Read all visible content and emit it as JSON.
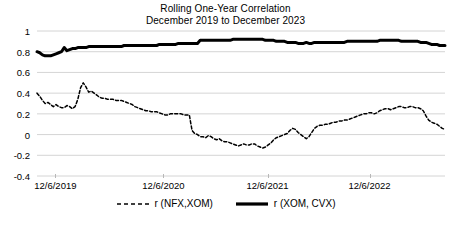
{
  "chart_data": {
    "type": "line",
    "title": "Rolling One-Year Correlation",
    "subtitle": "December 2019 to December 2023",
    "xlabel": "",
    "ylabel": "",
    "ylim": [
      -0.4,
      1
    ],
    "yticks": [
      1,
      0.8,
      0.6,
      0.4,
      0.2,
      0,
      -0.2,
      -0.4
    ],
    "ytick_labels": [
      "1",
      "0.8",
      "0.6",
      "0.4",
      "0.2",
      "0",
      "-0.2",
      "-0.4"
    ],
    "xtick_labels": [
      "12/6/2019",
      "12/6/2020",
      "12/6/2021",
      "12/6/2022"
    ],
    "xtick_positions": [
      0.045,
      0.31,
      0.565,
      0.815
    ],
    "grid": true,
    "legend_position": "bottom",
    "series": [
      {
        "name": "r (NFX,XOM)",
        "style": "dashed",
        "color": "#000000",
        "values": [
          0.4,
          0.37,
          0.33,
          0.3,
          0.31,
          0.29,
          0.27,
          0.29,
          0.27,
          0.26,
          0.26,
          0.28,
          0.27,
          0.25,
          0.27,
          0.34,
          0.45,
          0.5,
          0.46,
          0.41,
          0.42,
          0.4,
          0.38,
          0.36,
          0.35,
          0.35,
          0.34,
          0.34,
          0.34,
          0.33,
          0.33,
          0.33,
          0.32,
          0.31,
          0.3,
          0.29,
          0.27,
          0.26,
          0.25,
          0.24,
          0.23,
          0.23,
          0.22,
          0.22,
          0.22,
          0.21,
          0.2,
          0.19,
          0.19,
          0.2,
          0.2,
          0.2,
          0.2,
          0.2,
          0.19,
          0.19,
          0.19,
          0.04,
          0.01,
          0.0,
          -0.02,
          -0.02,
          -0.03,
          -0.01,
          -0.02,
          -0.04,
          -0.05,
          -0.04,
          -0.06,
          -0.07,
          -0.07,
          -0.08,
          -0.09,
          -0.1,
          -0.11,
          -0.1,
          -0.09,
          -0.1,
          -0.1,
          -0.09,
          -0.09,
          -0.11,
          -0.12,
          -0.13,
          -0.12,
          -0.1,
          -0.08,
          -0.05,
          -0.03,
          -0.02,
          -0.01,
          0.0,
          0.01,
          0.04,
          0.06,
          0.05,
          0.02,
          0.0,
          -0.02,
          -0.04,
          -0.02,
          0.02,
          0.06,
          0.08,
          0.09,
          0.09,
          0.1,
          0.1,
          0.11,
          0.12,
          0.12,
          0.13,
          0.13,
          0.14,
          0.14,
          0.15,
          0.16,
          0.17,
          0.18,
          0.19,
          0.2,
          0.2,
          0.21,
          0.21,
          0.2,
          0.21,
          0.23,
          0.24,
          0.25,
          0.25,
          0.24,
          0.25,
          0.26,
          0.27,
          0.27,
          0.26,
          0.26,
          0.27,
          0.27,
          0.26,
          0.26,
          0.25,
          0.23,
          0.18,
          0.14,
          0.12,
          0.11,
          0.1,
          0.08,
          0.06,
          0.05
        ]
      },
      {
        "name": "r (XOM, CVX)",
        "style": "solid",
        "color": "#000000",
        "values": [
          0.8,
          0.79,
          0.77,
          0.76,
          0.76,
          0.76,
          0.77,
          0.78,
          0.79,
          0.8,
          0.84,
          0.81,
          0.82,
          0.83,
          0.83,
          0.84,
          0.84,
          0.84,
          0.84,
          0.85,
          0.85,
          0.85,
          0.85,
          0.85,
          0.85,
          0.85,
          0.85,
          0.85,
          0.85,
          0.85,
          0.85,
          0.85,
          0.86,
          0.86,
          0.86,
          0.86,
          0.86,
          0.86,
          0.86,
          0.86,
          0.86,
          0.86,
          0.86,
          0.86,
          0.86,
          0.87,
          0.87,
          0.87,
          0.87,
          0.87,
          0.87,
          0.87,
          0.88,
          0.88,
          0.88,
          0.88,
          0.88,
          0.88,
          0.88,
          0.88,
          0.91,
          0.91,
          0.91,
          0.91,
          0.91,
          0.91,
          0.91,
          0.91,
          0.91,
          0.91,
          0.91,
          0.91,
          0.92,
          0.92,
          0.92,
          0.92,
          0.92,
          0.92,
          0.92,
          0.92,
          0.92,
          0.92,
          0.92,
          0.92,
          0.91,
          0.91,
          0.91,
          0.91,
          0.9,
          0.9,
          0.9,
          0.9,
          0.89,
          0.89,
          0.89,
          0.89,
          0.88,
          0.88,
          0.88,
          0.89,
          0.88,
          0.88,
          0.89,
          0.89,
          0.89,
          0.89,
          0.89,
          0.89,
          0.89,
          0.89,
          0.89,
          0.89,
          0.89,
          0.89,
          0.9,
          0.9,
          0.9,
          0.9,
          0.9,
          0.9,
          0.9,
          0.9,
          0.9,
          0.9,
          0.9,
          0.9,
          0.91,
          0.91,
          0.91,
          0.91,
          0.91,
          0.91,
          0.91,
          0.91,
          0.9,
          0.9,
          0.9,
          0.9,
          0.9,
          0.9,
          0.9,
          0.89,
          0.89,
          0.89,
          0.88,
          0.87,
          0.87,
          0.87,
          0.86,
          0.86,
          0.86
        ]
      }
    ]
  }
}
